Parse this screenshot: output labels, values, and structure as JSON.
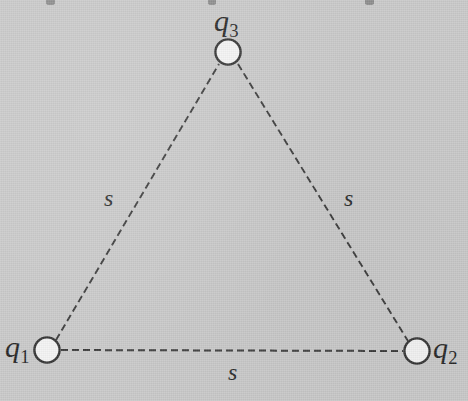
{
  "figure": {
    "kind": "physics-diagram",
    "background_color": "#c9c9c9",
    "ink_color": "#3a3a3a",
    "node_fill_color": "#f5f5f5",
    "width": 468,
    "height": 401
  },
  "charges": [
    {
      "id": "q1",
      "label": "q",
      "subscript": "1",
      "cx": 47,
      "cy": 350,
      "r": 13,
      "label_position": "left"
    },
    {
      "id": "q2",
      "label": "q",
      "subscript": "2",
      "cx": 417,
      "cy": 351,
      "r": 13,
      "label_position": "right"
    },
    {
      "id": "q3",
      "label": "q",
      "subscript": "3",
      "cx": 228,
      "cy": 52,
      "r": 13,
      "label_position": "above"
    }
  ],
  "sides": [
    {
      "id": "side-q1-q3",
      "label": "s",
      "from": "q1",
      "to": "q3",
      "label_x": 104,
      "label_y": 186
    },
    {
      "id": "side-q3-q2",
      "label": "s",
      "from": "q3",
      "to": "q2",
      "label_x": 344,
      "label_y": 186
    },
    {
      "id": "side-q1-q2",
      "label": "s",
      "from": "q1",
      "to": "q2",
      "label_x": 228,
      "label_y": 360
    }
  ],
  "line_style": {
    "pattern": "dashed",
    "dash": 7,
    "gap": 4,
    "width": 1.9
  },
  "edge_artifacts": [
    {
      "left": 46,
      "width": 9
    },
    {
      "left": 208,
      "width": 8
    },
    {
      "left": 365,
      "width": 9
    }
  ]
}
